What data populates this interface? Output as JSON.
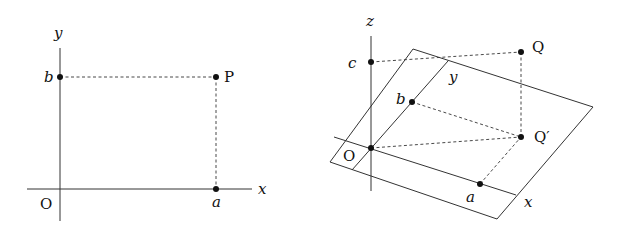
{
  "diagram_2d": {
    "axis_labels": {
      "x": "x",
      "y": "y"
    },
    "origin_label": "O",
    "point_label": "P",
    "x_tick_label": "a",
    "y_tick_label": "b"
  },
  "diagram_3d": {
    "axis_labels": {
      "x": "x",
      "y": "y",
      "z": "z"
    },
    "origin_label": "O",
    "point_label": "Q",
    "projection_label": "Q′",
    "x_tick_label": "a",
    "y_tick_label": "b",
    "z_tick_label": "c"
  }
}
